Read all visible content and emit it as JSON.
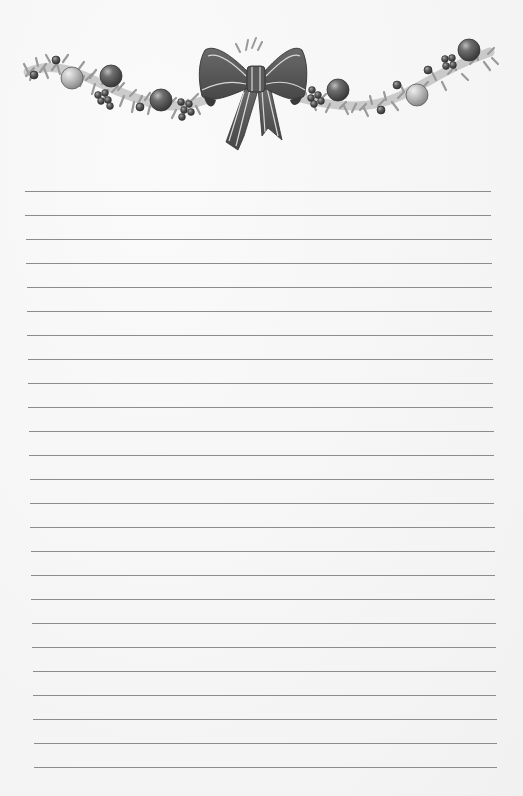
{
  "page": {
    "type": "lined stationery",
    "background_color": "#f6f6f6"
  },
  "header": {
    "decoration": "christmas-garland-with-bow",
    "bow_color": "#555555",
    "bow_stripe_color": "#dcdcdc",
    "garland_color": "#9a9a9a",
    "ornaments": [
      {
        "kind": "small-ball",
        "x": 34,
        "y": 75,
        "r": 4
      },
      {
        "kind": "small-ball",
        "x": 56,
        "y": 60,
        "r": 4
      },
      {
        "kind": "light-ball",
        "x": 72,
        "y": 78,
        "r": 11
      },
      {
        "kind": "dark-ball",
        "x": 111,
        "y": 76,
        "r": 11
      },
      {
        "kind": "berries",
        "x": 103,
        "y": 99
      },
      {
        "kind": "small-ball",
        "x": 140,
        "y": 107,
        "r": 4
      },
      {
        "kind": "dark-ball",
        "x": 161,
        "y": 100,
        "r": 11
      },
      {
        "kind": "berries",
        "x": 185,
        "y": 107
      },
      {
        "kind": "berries",
        "x": 316,
        "y": 96
      },
      {
        "kind": "dark-ball",
        "x": 338,
        "y": 90,
        "r": 11
      },
      {
        "kind": "small-ball",
        "x": 381,
        "y": 110,
        "r": 4
      },
      {
        "kind": "small-ball",
        "x": 397,
        "y": 85,
        "r": 4
      },
      {
        "kind": "light-ball",
        "x": 417,
        "y": 95,
        "r": 11
      },
      {
        "kind": "small-ball",
        "x": 428,
        "y": 70,
        "r": 4
      },
      {
        "kind": "berries",
        "x": 450,
        "y": 62
      },
      {
        "kind": "dark-ball",
        "x": 469,
        "y": 50,
        "r": 11
      }
    ]
  },
  "ruled_lines": {
    "count": 25,
    "first_y": 191,
    "spacing": 24,
    "left_start": 25,
    "left_end": 34,
    "right_start": 491,
    "right_end": 497,
    "color": "#8c8c8c"
  }
}
